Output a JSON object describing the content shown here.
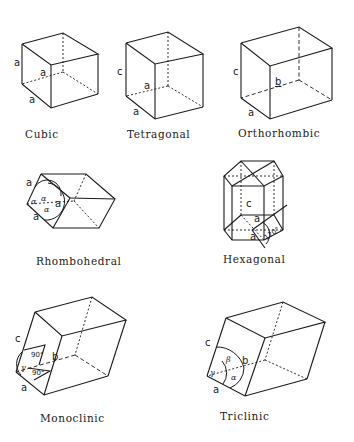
{
  "systems": [
    {
      "name": "Cubic",
      "labels": {
        "side": "a",
        "depth": "a",
        "base": "a"
      }
    },
    {
      "name": "Tetragonal",
      "labels": {
        "side": "c",
        "depth": "a",
        "base": "a"
      }
    },
    {
      "name": "Orthorhombic",
      "labels": {
        "side": "c",
        "depth": "b",
        "base": "a"
      }
    },
    {
      "name": "Rhombohedral",
      "labels": {
        "a1": "a",
        "a2": "a",
        "a3": "a",
        "angle1": "α",
        "angle2": "α",
        "angle3": "α"
      }
    },
    {
      "name": "Hexagonal",
      "labels": {
        "c": "c",
        "a1": "a",
        "a2": "a",
        "angle": "120°"
      }
    },
    {
      "name": "Monoclinic",
      "labels": {
        "c": "c",
        "b": "b",
        "a": "a",
        "angle1": "90°",
        "angle2": "90°",
        "gamma": "γ"
      }
    },
    {
      "name": "Triclinic",
      "labels": {
        "c": "c",
        "b": "b",
        "a": "a",
        "alpha": "α",
        "beta": "β",
        "gamma": "γ"
      }
    }
  ]
}
